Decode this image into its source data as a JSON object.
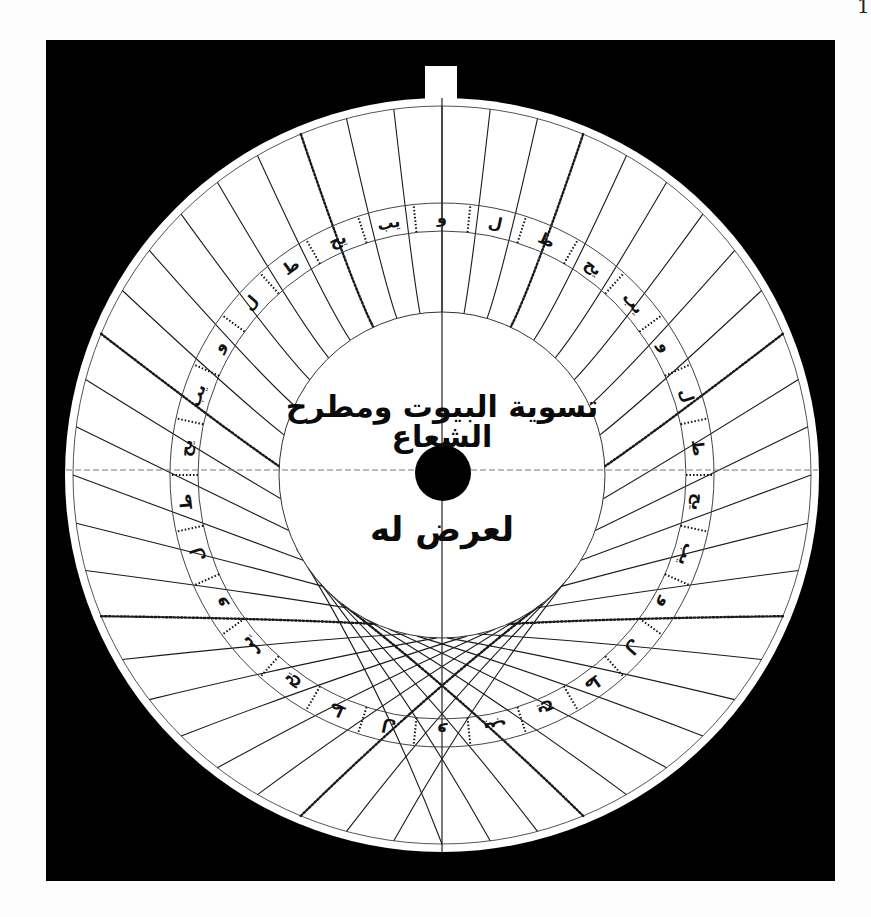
{
  "page": {
    "page_number": "1",
    "background_color": "#fdfdfd",
    "frame_color": "#000000"
  },
  "plate": {
    "description": "Astrolabe plate with curved house-division lines",
    "center": [
      442,
      475
    ],
    "outer_radius": 377,
    "rim_radius": 369,
    "inner_circle_radius": 163,
    "hole_radius": 28,
    "ring_outer_radius": 272,
    "ring_inner_radius": 244,
    "line_color": "#1a1a1a",
    "plate_color": "#ffffff",
    "central_text": {
      "line1": "تسوية البيوت ومطرح الشعاع",
      "line2": "لعرض له"
    },
    "ring_labels": [
      "و",
      "ل",
      "ط",
      "يح",
      "يب",
      "و",
      "ل",
      "ط",
      "يح",
      "يب",
      "و",
      "ل",
      "ط",
      "يح",
      "يب",
      "و",
      "ل",
      "ط",
      "يح",
      "يب",
      "و",
      "ل",
      "ط",
      "يح",
      "يب",
      "و",
      "ل",
      "ط",
      "يح",
      "يب"
    ]
  }
}
